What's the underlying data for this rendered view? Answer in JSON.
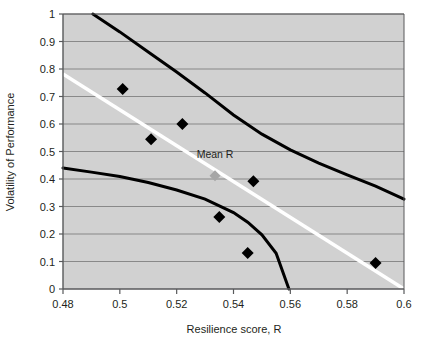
{
  "chart_data": {
    "type": "scatter",
    "title": "",
    "xlabel": "Resilience score, R",
    "ylabel": "Volatility of Performance",
    "xlim": [
      0.48,
      0.6
    ],
    "ylim": [
      0,
      1
    ],
    "grid": true,
    "grid_axis": "y",
    "legend": "none",
    "xticks": [
      "0.48",
      "0.5",
      "0.52",
      "0.54",
      "0.56",
      "0.58",
      "0.6"
    ],
    "xtick_values": [
      0.48,
      0.5,
      0.52,
      0.54,
      0.56,
      0.58,
      0.6
    ],
    "yticks": [
      "0",
      "0.1",
      "0.2",
      "0.3",
      "0.4",
      "0.5",
      "0.6",
      "0.7",
      "0.8",
      "0.9",
      "1"
    ],
    "ytick_values": [
      0,
      0.1,
      0.2,
      0.3,
      0.4,
      0.5,
      0.6,
      0.7,
      0.8,
      0.9,
      1
    ],
    "plot_background": "#d1d1d1",
    "gridline_color": "#808080",
    "axis_color": "#58595b",
    "series": [
      {
        "name": "Observations",
        "type": "scatter",
        "marker": "diamond",
        "color": "#000000",
        "points": [
          {
            "x": 0.501,
            "y": 0.727
          },
          {
            "x": 0.511,
            "y": 0.545
          },
          {
            "x": 0.522,
            "y": 0.6
          },
          {
            "x": 0.547,
            "y": 0.392
          },
          {
            "x": 0.535,
            "y": 0.262
          },
          {
            "x": 0.545,
            "y": 0.131
          },
          {
            "x": 0.59,
            "y": 0.095
          }
        ]
      },
      {
        "name": "Mean R",
        "type": "scatter",
        "marker": "diamond",
        "color": "#a6a6a6",
        "points": [
          {
            "x": 0.5335,
            "y": 0.412
          }
        ]
      },
      {
        "name": "Regression line",
        "type": "line",
        "color": "#ffffff",
        "width": 3.5,
        "points": [
          {
            "x": 0.48,
            "y": 0.782
          },
          {
            "x": 0.6,
            "y": 0.0
          }
        ]
      },
      {
        "name": "Upper confidence bound",
        "type": "curve",
        "color": "#000000",
        "width": 3,
        "points": [
          {
            "x": 0.4905,
            "y": 1.0
          },
          {
            "x": 0.5,
            "y": 0.935
          },
          {
            "x": 0.51,
            "y": 0.862
          },
          {
            "x": 0.52,
            "y": 0.789
          },
          {
            "x": 0.53,
            "y": 0.713
          },
          {
            "x": 0.54,
            "y": 0.633
          },
          {
            "x": 0.55,
            "y": 0.563
          },
          {
            "x": 0.56,
            "y": 0.506
          },
          {
            "x": 0.57,
            "y": 0.458
          },
          {
            "x": 0.58,
            "y": 0.415
          },
          {
            "x": 0.59,
            "y": 0.374
          },
          {
            "x": 0.6,
            "y": 0.327
          }
        ]
      },
      {
        "name": "Lower confidence bound",
        "type": "curve",
        "color": "#000000",
        "width": 3,
        "points": [
          {
            "x": 0.48,
            "y": 0.44
          },
          {
            "x": 0.49,
            "y": 0.425
          },
          {
            "x": 0.5,
            "y": 0.409
          },
          {
            "x": 0.51,
            "y": 0.387
          },
          {
            "x": 0.52,
            "y": 0.36
          },
          {
            "x": 0.53,
            "y": 0.327
          },
          {
            "x": 0.54,
            "y": 0.278
          },
          {
            "x": 0.545,
            "y": 0.243
          },
          {
            "x": 0.55,
            "y": 0.197
          },
          {
            "x": 0.555,
            "y": 0.13
          },
          {
            "x": 0.5595,
            "y": 0.0
          }
        ]
      }
    ],
    "annotations": [
      {
        "text": "Mean R",
        "x": 0.5335,
        "y": 0.478,
        "anchor": "middle"
      }
    ]
  }
}
